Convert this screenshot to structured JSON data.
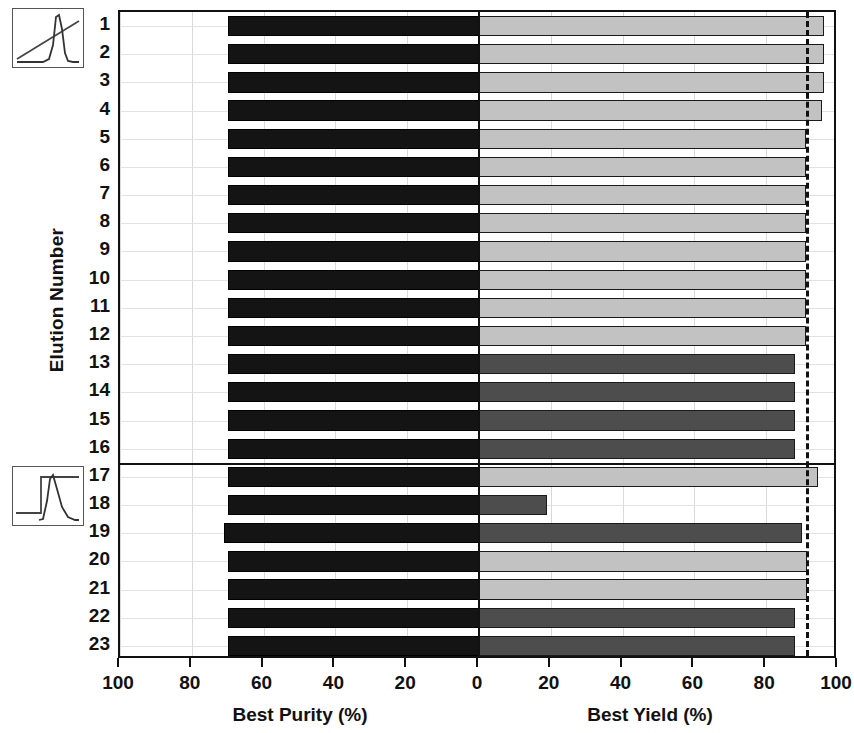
{
  "chart_data": {
    "type": "bar",
    "orientation": "horizontal",
    "layout": "mirrored-dual-axis",
    "title": "",
    "ylabel": "Elution Number",
    "xlabel_left": "Best Purity (%)",
    "xlabel_right": "Best Yield (%)",
    "grid": true,
    "legend": "none",
    "left_axis": {
      "label": "Best Purity (%)",
      "direction": "reversed",
      "ticks": [
        100,
        80,
        60,
        40,
        20,
        0
      ],
      "tick_labels": [
        "100",
        "80",
        "60",
        "40",
        "20",
        "0"
      ],
      "lim": [
        100,
        0
      ]
    },
    "right_axis": {
      "label": "Best Yield (%)",
      "direction": "normal",
      "ticks": [
        0,
        20,
        40,
        60,
        80,
        100
      ],
      "tick_labels": [
        "0",
        "20",
        "40",
        "60",
        "80",
        "100"
      ],
      "lim": [
        0,
        100
      ]
    },
    "categories": [
      "1",
      "2",
      "3",
      "4",
      "5",
      "6",
      "7",
      "8",
      "9",
      "10",
      "11",
      "12",
      "13",
      "14",
      "15",
      "16",
      "17",
      "18",
      "19",
      "20",
      "21",
      "22",
      "23"
    ],
    "annotations": {
      "threshold_value": 91,
      "threshold_style": "dashed-vertical",
      "group_separator_after_category": "16"
    },
    "series": [
      {
        "name": "Best Purity (%)",
        "axis": "left",
        "color": "#141414",
        "values": [
          70,
          70,
          70,
          70,
          70,
          70,
          70,
          70,
          70,
          70,
          70,
          70,
          70,
          70,
          70,
          70,
          70,
          70,
          71,
          70,
          70,
          70,
          70
        ]
      },
      {
        "name": "Best Yield (%)",
        "axis": "right",
        "values": [
          96,
          96,
          96,
          95.5,
          91,
          91,
          91,
          91,
          91,
          91,
          91,
          91,
          88,
          88,
          88,
          88,
          94.5,
          19,
          90,
          91.5,
          91.5,
          88,
          88
        ],
        "colors": [
          "#c2c2c2",
          "#c2c2c2",
          "#c2c2c2",
          "#c2c2c2",
          "#c2c2c2",
          "#c2c2c2",
          "#c2c2c2",
          "#c2c2c2",
          "#c2c2c2",
          "#c2c2c2",
          "#c2c2c2",
          "#c2c2c2",
          "#4d4d4d",
          "#4d4d4d",
          "#4d4d4d",
          "#4d4d4d",
          "#c2c2c2",
          "#4d4d4d",
          "#4d4d4d",
          "#c2c2c2",
          "#c2c2c2",
          "#4d4d4d",
          "#4d4d4d"
        ]
      }
    ]
  },
  "insets": [
    {
      "name": "linear-gradient-chromatogram",
      "description": "linear gradient with sharp peak"
    },
    {
      "name": "step-gradient-chromatogram",
      "description": "step gradient with tailing peak"
    }
  ],
  "colors": {
    "bar_purity": "#141414",
    "bar_yield_light": "#c2c2c2",
    "bar_yield_dark": "#4d4d4d",
    "axis": "#111111",
    "grid": "#d9d9d9",
    "background": "#ffffff"
  }
}
